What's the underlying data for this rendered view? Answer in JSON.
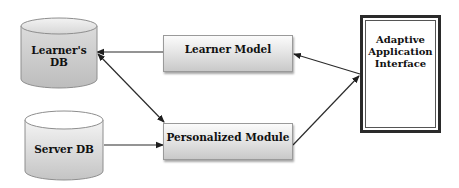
{
  "diagram": {
    "nodes": {
      "learners_db": {
        "label_line1": "Learner's",
        "label_line2": "DB",
        "shape": "cylinder"
      },
      "server_db": {
        "label": "Server DB",
        "shape": "cylinder"
      },
      "learner_model": {
        "label": "Learner Model",
        "shape": "rectangle"
      },
      "personalized_module": {
        "label": "Personalized Module",
        "shape": "rectangle"
      },
      "adaptive_interface": {
        "label_line1": "Adaptive",
        "label_line2": "Application",
        "label_line3": "Interface",
        "shape": "double-border-rectangle"
      }
    },
    "edges": [
      {
        "from": "learner_model",
        "to": "learners_db",
        "direction": "one-way"
      },
      {
        "from": "learners_db",
        "to": "personalized_module",
        "direction": "two-way"
      },
      {
        "from": "server_db",
        "to": "personalized_module",
        "direction": "one-way"
      },
      {
        "from": "adaptive_interface",
        "to": "learner_model",
        "direction": "one-way"
      },
      {
        "from": "personalized_module",
        "to": "adaptive_interface",
        "direction": "one-way"
      }
    ],
    "colors": {
      "line": "#2b2b2b",
      "shape_fill_light": "#f2f2f2",
      "shape_fill_dark": "#c4c4c4",
      "frame_border": "#2a2a2a"
    }
  }
}
